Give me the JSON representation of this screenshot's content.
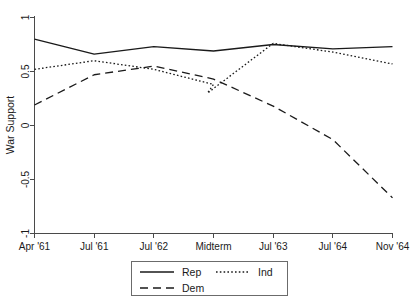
{
  "chart_data": {
    "type": "line",
    "title": "",
    "xlabel": "",
    "ylabel": "War Support",
    "x": [
      "Apr '61",
      "Jul '61",
      "Jul '62",
      "Midterm",
      "Jul '63",
      "Jul '64",
      "Nov '64"
    ],
    "categories": [
      "Apr '61",
      "Jul '61",
      "Jul '62",
      "Midterm",
      "Jul '63",
      "Jul '64",
      "Nov '64"
    ],
    "xlim": [
      0,
      6
    ],
    "ylim": [
      -1,
      1
    ],
    "yticks": [
      1,
      0.5,
      0,
      -0.5,
      -1
    ],
    "ytick_labels": [
      "1",
      "0.5",
      "0",
      "-0.5",
      "-1"
    ],
    "grid": false,
    "legend_position": "bottom",
    "series": [
      {
        "name": "Rep",
        "style": "solid",
        "values": [
          0.8,
          0.66,
          0.73,
          0.69,
          0.75,
          0.71,
          0.73
        ]
      },
      {
        "name": "Dem",
        "style": "dashed",
        "values": [
          0.19,
          0.47,
          0.55,
          0.43,
          0.18,
          -0.13,
          -0.67
        ]
      },
      {
        "name": "Ind",
        "style": "dotted",
        "values": [
          0.52,
          0.6,
          0.52,
          0.38,
          0.76,
          0.68,
          0.57
        ]
      }
    ],
    "annotations": {
      "ind_midterm_dip_value": 0.3,
      "ind_midterm_dip_x": 3.0
    }
  },
  "legend": {
    "entries": [
      {
        "label": "Rep",
        "style": "solid"
      },
      {
        "label": "Ind",
        "style": "dotted"
      },
      {
        "label": "Dem",
        "style": "dashed"
      }
    ]
  },
  "axes": {
    "y_title": "War Support",
    "y_tick_labels": [
      "1",
      "0.5",
      "0",
      "-0.5",
      "-1"
    ],
    "x_tick_labels": [
      "Apr '61",
      "Jul '61",
      "Jul '62",
      "Midterm",
      "Jul '63",
      "Jul '64",
      "Nov '64"
    ]
  },
  "colors": {
    "line": "#1a1a1a",
    "axis": "#4a4a4a",
    "background": "#ffffff",
    "legend_border": "#6b6b6b"
  }
}
